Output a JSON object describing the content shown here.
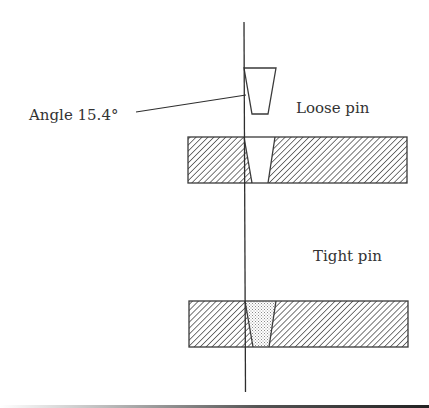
{
  "figure": {
    "labels": {
      "angle": "Angle 15.4°",
      "loose": "Loose pin",
      "tight": "Tight pin"
    },
    "annotation": {
      "angle_degrees": 15.4
    },
    "parts": [
      {
        "name": "loose-pin",
        "fill": "stippled"
      },
      {
        "name": "plate-with-empty-hole",
        "fill": "hatched"
      },
      {
        "name": "plate-with-seated-pin",
        "fill": "hatched"
      },
      {
        "name": "seated-pin",
        "fill": "stippled"
      },
      {
        "name": "axis-line",
        "fill": "none"
      }
    ],
    "colors": {
      "stroke": "#3a3a3a",
      "text": "#333333",
      "hatch": "#555555",
      "stipple": "#8a8a8a",
      "background": "#ffffff"
    }
  }
}
